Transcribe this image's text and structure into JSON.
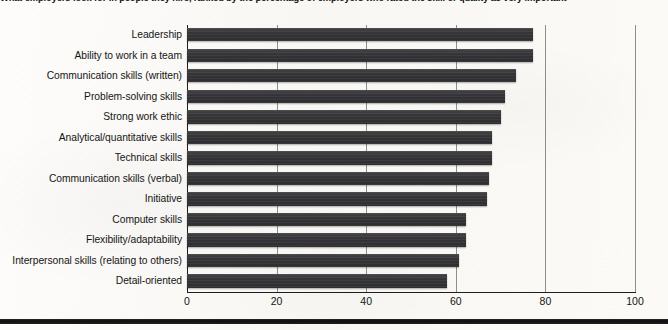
{
  "caption": {
    "text": "What employers look for in people they hire, ranked by the percentage of employers who rated the skill or quality as very important"
  },
  "axis": {
    "ticks": [
      "0",
      "20",
      "40",
      "60",
      "80",
      "100"
    ],
    "x_min": 0,
    "x_max": 100
  },
  "colors": {
    "bar": "#343436",
    "gridline": "#8e8e8e",
    "axis": "#1e1e1e",
    "page": "#fbfaf8"
  },
  "chart_data": {
    "type": "bar",
    "orientation": "horizontal",
    "title": "What employers look for in people they hire, ranked by the percentage of employers who rated the skill or quality as very important",
    "xlabel": "",
    "ylabel": "",
    "xlim": [
      0,
      100
    ],
    "grid": true,
    "legend": "none",
    "categories": [
      "Leadership",
      "Ability to work in a team",
      "Communication skills (written)",
      "Problem-solving skills",
      "Strong work ethic",
      "Analytical/quantitative skills",
      "Technical skills",
      "Communication skills (verbal)",
      "Initiative",
      "Computer skills",
      "Flexibility/adaptability",
      "Interpersonal skills (relating to others)",
      "Detail-oriented"
    ],
    "values": [
      77.2,
      77.2,
      73.4,
      71.0,
      70.0,
      68.0,
      68.0,
      67.5,
      67.0,
      62.3,
      62.3,
      60.7,
      58.0
    ]
  }
}
